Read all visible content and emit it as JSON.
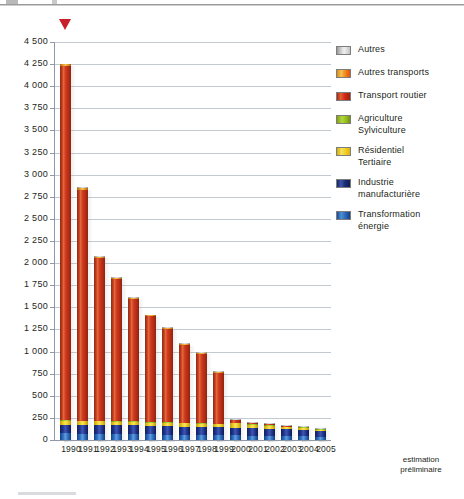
{
  "chart_data": {
    "type": "bar",
    "title": "",
    "subtitle": "",
    "xlabel": "",
    "ylabel": "",
    "stacked": true,
    "grid": true,
    "legend_position": "right",
    "ylim": [
      0,
      4500
    ],
    "ytick_step": 250,
    "ytick_labels": [
      "4 500",
      "4 250",
      "4 000",
      "3 750",
      "3 500",
      "3 250",
      "3 000",
      "2 750",
      "2 500",
      "2 250",
      "2 000",
      "1 750",
      "1 500",
      "1 250",
      "1 000",
      "750",
      "500",
      "250",
      "0"
    ],
    "ytick_values": [
      4500,
      4250,
      4000,
      3750,
      3500,
      3250,
      3000,
      2750,
      2500,
      2250,
      2000,
      1750,
      1500,
      1250,
      1000,
      750,
      500,
      250,
      0
    ],
    "categories": [
      "1990",
      "1991",
      "1992",
      "1993",
      "1994",
      "1995",
      "1996",
      "1997",
      "1998",
      "1999",
      "2000",
      "2001",
      "2002",
      "2003",
      "2004",
      "2005"
    ],
    "x_note": "estimation\npréliminaire",
    "x_note_attached_to": "2005",
    "series": [
      {
        "name": "Transformation énergie",
        "color": "#2f6fc0",
        "values": [
          75,
          72,
          70,
          68,
          66,
          64,
          62,
          60,
          58,
          56,
          54,
          50,
          48,
          45,
          43,
          38
        ]
      },
      {
        "name": "Industrie manufacturière",
        "color": "#22368f",
        "values": [
          100,
          98,
          100,
          97,
          99,
          96,
          95,
          92,
          90,
          88,
          86,
          82,
          80,
          76,
          73,
          62
        ]
      },
      {
        "name": "Résidentiel Tertiaire",
        "color": "#f0d22a",
        "values": [
          42,
          40,
          40,
          39,
          38,
          37,
          36,
          35,
          34,
          33,
          50,
          42,
          36,
          25,
          23,
          15
        ]
      },
      {
        "name": "Agriculture Sylviculture",
        "color": "#9cc221",
        "values": [
          8,
          8,
          8,
          7,
          7,
          7,
          7,
          6,
          6,
          6,
          6,
          5,
          5,
          5,
          4,
          4
        ]
      },
      {
        "name": "Transport routier",
        "color": "#cf3a20",
        "values": [
          4000,
          2610,
          1840,
          1605,
          1390,
          1195,
          1060,
          885,
          790,
          580,
          30,
          12,
          8,
          6,
          4,
          3
        ]
      },
      {
        "name": "Autres transports",
        "color": "#f3bf54",
        "values": [
          22,
          20,
          15,
          13,
          9,
          10,
          9,
          11,
          11,
          11,
          3,
          3,
          2,
          2,
          2,
          2
        ]
      },
      {
        "name": "Autres",
        "color": "#d6d6d6",
        "values": [
          3,
          2,
          2,
          1,
          1,
          1,
          1,
          1,
          1,
          1,
          1,
          1,
          1,
          1,
          1,
          1
        ]
      }
    ],
    "totals": [
      4250,
      2848,
      2075,
      1830,
      1610,
      1410,
      1270,
      1090,
      990,
      775,
      230,
      195,
      180,
      160,
      150,
      125
    ]
  },
  "legend": {
    "items": [
      {
        "label": "Autres",
        "swatch_class": "sw-autres",
        "name": "legend-swatch-autres"
      },
      {
        "label": "Autres transports",
        "swatch_class": "sw-autres-transports",
        "name": "legend-swatch-autres-transports"
      },
      {
        "label": "Transport routier",
        "swatch_class": "sw-transport-routier",
        "name": "legend-swatch-transport-routier"
      },
      {
        "label": "Agriculture\nSylviculture",
        "swatch_class": "sw-agriculture",
        "name": "legend-swatch-agriculture"
      },
      {
        "label": "Résidentiel\nTertiaire",
        "swatch_class": "sw-residentiel",
        "name": "legend-swatch-residentiel"
      },
      {
        "label": "Industrie\nmanufacturière",
        "swatch_class": "sw-industrie",
        "name": "legend-swatch-industrie"
      },
      {
        "label": "Transformation\nénergie",
        "swatch_class": "sw-transformation",
        "name": "legend-swatch-transformation"
      }
    ]
  },
  "marker": {
    "name": "red-triangle-marker",
    "color": "#c8202a"
  }
}
